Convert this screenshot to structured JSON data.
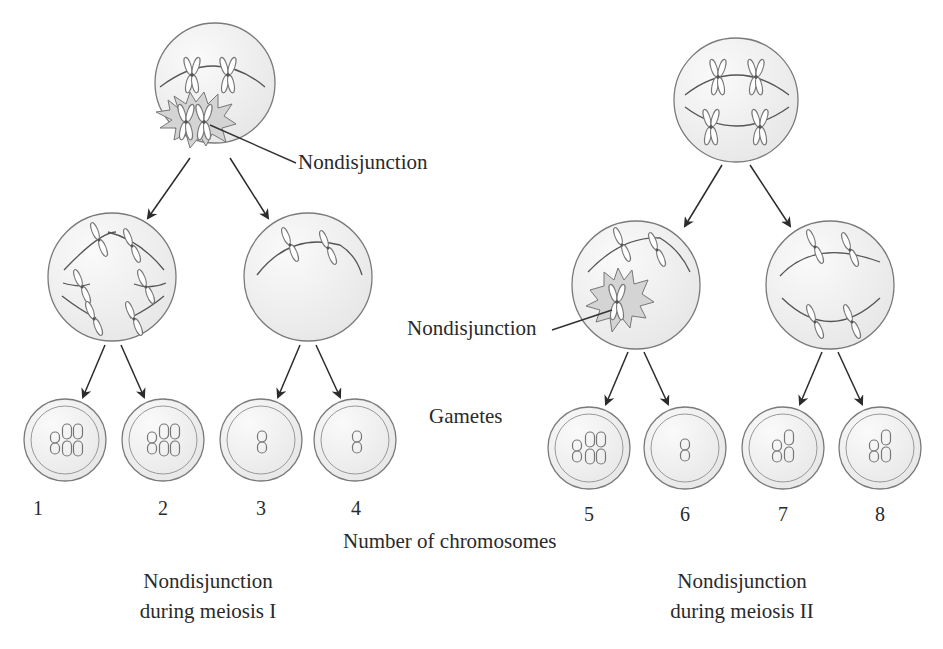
{
  "diagram": {
    "type": "flow",
    "topic": "Nondisjunction in meiosis",
    "labels": {
      "nondisjunction_1": "Nondisjunction",
      "nondisjunction_2": "Nondisjunction",
      "gametes": "Gametes",
      "axis_label": "Number of chromosomes"
    },
    "panels": [
      {
        "caption_line1": "Nondisjunction",
        "caption_line2": "during meiosis I",
        "gametes": [
          {
            "count": "1",
            "chromosomes": 3
          },
          {
            "count": "2",
            "chromosomes": 3
          },
          {
            "count": "3",
            "chromosomes": 1
          },
          {
            "count": "4",
            "chromosomes": 1
          }
        ]
      },
      {
        "caption_line1": "Nondisjunction",
        "caption_line2": "during meiosis II",
        "gametes": [
          {
            "count": "5",
            "chromosomes": 3
          },
          {
            "count": "6",
            "chromosomes": 1
          },
          {
            "count": "7",
            "chromosomes": 2
          },
          {
            "count": "8",
            "chromosomes": 2
          }
        ]
      }
    ],
    "colors": {
      "cell_fill": "#efefef",
      "outline": "#6a6a6a",
      "arrow": "#2b2b2b",
      "burst_fill": "#d4d4d4"
    }
  }
}
